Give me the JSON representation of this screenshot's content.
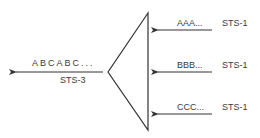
{
  "diagram": {
    "output": {
      "sequence": "ABCABC...",
      "signal": "STS-3"
    },
    "inputs": [
      {
        "sequence": "AAA...",
        "signal": "STS-1"
      },
      {
        "sequence": "BBB...",
        "signal": "STS-1"
      },
      {
        "sequence": "CCC...",
        "signal": "STS-1"
      }
    ],
    "colors": {
      "line": "#333333",
      "text": "#3a3a3a"
    }
  }
}
